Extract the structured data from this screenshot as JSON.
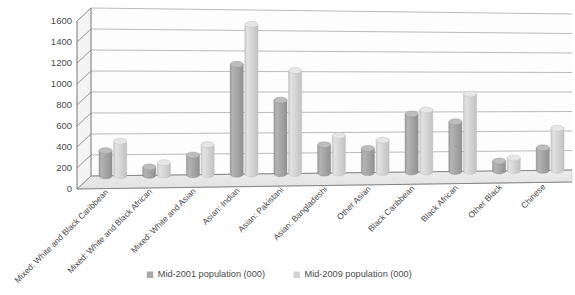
{
  "chart_data": {
    "type": "bar",
    "title": "",
    "subtitle": "",
    "xlabel": "",
    "ylabel": "",
    "ylim": [
      0,
      1600
    ],
    "ytick_step": 200,
    "yticks": [
      "0",
      "200",
      "400",
      "600",
      "800",
      "1000",
      "1200",
      "1400",
      "1600"
    ],
    "grid": true,
    "legend_position": "bottom-center",
    "style": "3d-cylinder",
    "categories": [
      "Mixed: White and Black Caribbean",
      "Mixed: White and Black African",
      "Mixed: White and Asian",
      "Asian: Indian",
      "Asian: Pakistani",
      "Asian: Bangladeshi",
      "Other Asian",
      "Black Caribbean",
      "Black African",
      "Other Black",
      "Chinese"
    ],
    "series": [
      {
        "name": "Mid-2001 population (000)",
        "color": "#a8a8a8",
        "values": [
          240,
          80,
          190,
          1070,
          720,
          280,
          240,
          580,
          500,
          100,
          230
        ]
      },
      {
        "name": "Mid-2009 population (000)",
        "color": "#d2d2d2",
        "values": [
          330,
          120,
          290,
          1460,
          1010,
          370,
          320,
          620,
          780,
          130,
          430
        ]
      }
    ]
  },
  "legend": {
    "items": [
      {
        "label": "Mid-2001 population (000)",
        "color": "#a8a8a8"
      },
      {
        "label": "Mid-2009 population (000)",
        "color": "#d2d2d2"
      }
    ]
  },
  "colors": {
    "background": "#ffffff",
    "plot_floor": "#e9e9e9",
    "plot_wall": "#fdfdfd",
    "gridline": "#8d8d8d",
    "axis": "#7c7c7c",
    "series_1": "#a8a8a8",
    "series_2": "#d2d2d2",
    "text": "#4a4a4a"
  }
}
